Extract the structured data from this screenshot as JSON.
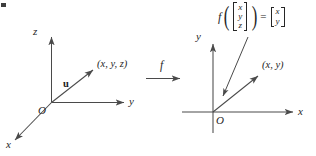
{
  "figure": {
    "background_color": "#ffffff",
    "stroke_color": "#4a4a4a",
    "text_color": "#262626"
  },
  "left_diagram": {
    "name": "three-dimensional-coordinate-system",
    "axes": [
      {
        "id": "z",
        "label": "z",
        "direction": "up"
      },
      {
        "id": "y",
        "label": "y",
        "direction": "right"
      },
      {
        "id": "x",
        "label": "x",
        "direction": "down-left"
      }
    ],
    "origin_label": "O",
    "vector_label": "u",
    "point_label": "(x, y, z)"
  },
  "mapping": {
    "label": "f",
    "arrow": "right-arrow"
  },
  "right_diagram": {
    "name": "two-dimensional-coordinate-system",
    "axes": [
      {
        "id": "y",
        "label": "y",
        "direction": "up"
      },
      {
        "id": "x",
        "label": "x",
        "direction": "right"
      }
    ],
    "origin_label": "O",
    "point_label": "(x, y)"
  },
  "formula": {
    "function_name": "f",
    "open_paren": "(",
    "close_paren": ")",
    "equals": "=",
    "input_vector": [
      "x",
      "y",
      "z"
    ],
    "output_vector": [
      "x",
      "y"
    ]
  }
}
